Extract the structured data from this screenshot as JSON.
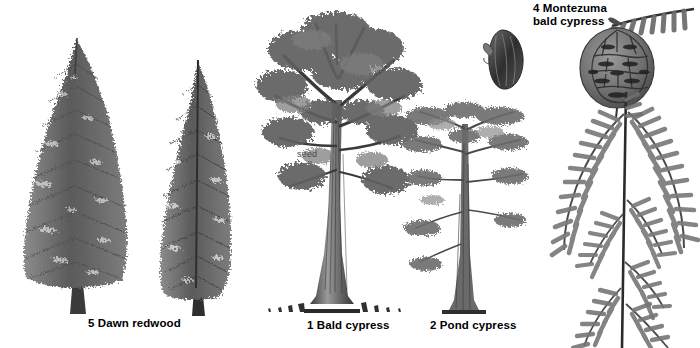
{
  "figure": {
    "title_absent": true,
    "background_color": "#ffffff",
    "ink_color": "#4b4b4b",
    "style": "grayscale botanical illustration plate"
  },
  "labels": [
    {
      "id": "dawn-redwood",
      "text": "5 Dawn redwood",
      "x": 88,
      "y": 318,
      "lines": [
        "5 Dawn redwood"
      ]
    },
    {
      "id": "bald-cypress",
      "text": "1 Bald cypress",
      "x": 307,
      "y": 320,
      "lines": [
        "1 Bald cypress"
      ]
    },
    {
      "id": "pond-cypress",
      "text": "2 Pond cypress",
      "x": 430,
      "y": 320,
      "lines": [
        "2 Pond cypress"
      ]
    },
    {
      "id": "montezuma",
      "text": "4 Montezuma bald cypress",
      "x": 533,
      "y": 3,
      "lines": [
        "4 Montezuma",
        "bald cypress"
      ]
    }
  ],
  "annotations": [
    {
      "id": "seed-callout",
      "text": "seed",
      "x": 297,
      "y": 150
    }
  ],
  "specimens": [
    {
      "id": "dawn-redwood-broad",
      "common_name": "Dawn redwood",
      "number": 5,
      "form": "broad conical conifer",
      "x": 20,
      "y": 38,
      "width": 120,
      "height": 278
    },
    {
      "id": "dawn-redwood-narrow",
      "common_name": "Dawn redwood",
      "number": 5,
      "form": "narrow columnar conifer",
      "x": 150,
      "y": 62,
      "width": 95,
      "height": 254
    },
    {
      "id": "bald-cypress-tree",
      "common_name": "Bald cypress",
      "number": 1,
      "form": "spreading crown with buttressed trunk and knees",
      "x": 262,
      "y": 8,
      "width": 160,
      "height": 310
    },
    {
      "id": "pond-cypress-tree",
      "common_name": "Pond cypress",
      "number": 2,
      "form": "narrow crown, sparse horizontal branches",
      "x": 405,
      "y": 108,
      "width": 120,
      "height": 208
    },
    {
      "id": "montezuma-cone",
      "common_name": "Montezuma bald cypress",
      "number": 4,
      "form": "mature seed cone",
      "x": 578,
      "y": 30,
      "width": 80,
      "height": 78
    },
    {
      "id": "montezuma-foliage",
      "common_name": "Montezuma bald cypress",
      "number": 4,
      "form": "pinnate foliage spray on shoot",
      "x": 552,
      "y": 95,
      "width": 143,
      "height": 250
    },
    {
      "id": "montezuma-sprig",
      "common_name": "Montezuma bald cypress",
      "number": 4,
      "form": "leaf sprig",
      "x": 610,
      "y": 2,
      "width": 85,
      "height": 32
    },
    {
      "id": "bald-cypress-seed",
      "common_name": "Bald cypress",
      "number": 1,
      "form": "seed / cone scale detail",
      "x": 487,
      "y": 30,
      "width": 40,
      "height": 62
    }
  ],
  "icons": {
    "tree": "conifer-tree-icon",
    "cone": "seed-cone-icon",
    "frond": "pinnate-frond-icon"
  }
}
